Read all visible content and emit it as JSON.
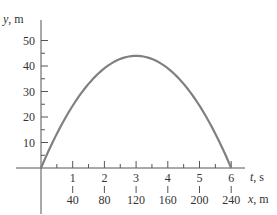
{
  "chart_data": {
    "type": "line",
    "title": "",
    "xlabel": "t, s",
    "xlabel_var": "t",
    "xlabel_unit": ", s",
    "x2label": "x, m",
    "x2label_var": "x",
    "x2label_unit": ", m",
    "ylabel": "y, m",
    "ylabel_var": "y",
    "ylabel_unit": ", m",
    "xlim": [
      0,
      6.1
    ],
    "ylim": [
      0,
      55
    ],
    "x_ticks": [
      1,
      2,
      3,
      4,
      5,
      6
    ],
    "x_tick_labels": [
      "1",
      "2",
      "3",
      "4",
      "5",
      "6"
    ],
    "x_minor_ticks": [
      0.5,
      1.5,
      2.5,
      3.5,
      4.5,
      5.5
    ],
    "x2_tick_labels": [
      "40",
      "80",
      "120",
      "160",
      "200",
      "240"
    ],
    "y_ticks": [
      10,
      20,
      30,
      40,
      50
    ],
    "y_tick_labels": [
      "10",
      "20",
      "30",
      "40",
      "50"
    ],
    "y_minor_ticks": [
      5,
      15,
      25,
      35,
      45
    ],
    "grid": false,
    "series": [
      {
        "name": "trajectory",
        "color": "#808080",
        "vx": 40,
        "vy": 30,
        "g": 9.81,
        "x": [
          0,
          0.5,
          1,
          1.5,
          2,
          2.5,
          3,
          3.06,
          3.5,
          4,
          4.5,
          5,
          5.5,
          6,
          6.12
        ],
        "y": [
          0,
          13.8,
          25.1,
          34.0,
          40.4,
          44.3,
          45.9,
          45.9,
          44.9,
          41.5,
          35.7,
          27.4,
          16.6,
          3.4,
          0
        ]
      }
    ]
  }
}
